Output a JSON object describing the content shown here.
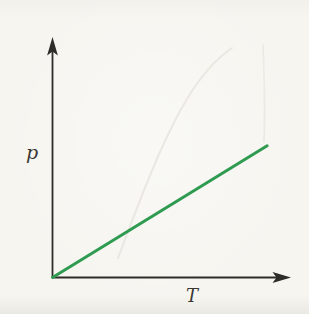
{
  "figure": {
    "background_color": "#f6f5f0",
    "axis_color": "#2e2c29",
    "label_color": "#3a3733",
    "ghost_color": "#e8e6df"
  },
  "chart_data": {
    "type": "line",
    "title": "",
    "xlabel": "T",
    "ylabel": "p",
    "x_tick_labels": [],
    "y_tick_labels": [],
    "grid": false,
    "legend": false,
    "xlim": [
      0,
      1
    ],
    "ylim": [
      0,
      1
    ],
    "series": [
      {
        "name": "p-vs-T-line",
        "color": "#2f9b51",
        "stroke_width": 3,
        "x": [
          0,
          0.9
        ],
        "y": [
          0,
          0.55
        ]
      }
    ]
  }
}
